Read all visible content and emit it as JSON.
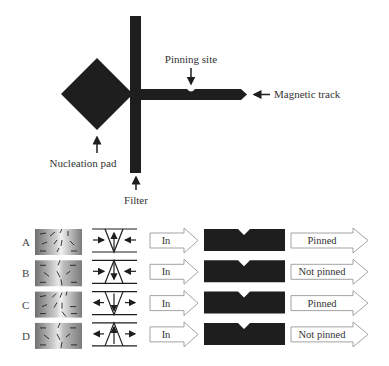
{
  "top_diagram": {
    "labels": {
      "pinning_site": "Pinning site",
      "magnetic_track": "Magnetic track",
      "nucleation_pad": "Nucleation pad",
      "filter": "Filter"
    },
    "colors": {
      "structure": "#1e1e1e",
      "text": "#333333"
    }
  },
  "rows": [
    {
      "id": "A",
      "wall_shape": "V-down",
      "center_arrow": "up",
      "side_arrows": "inward",
      "input": "In",
      "result": "Pinned"
    },
    {
      "id": "B",
      "wall_shape": "V-up",
      "center_arrow": "down",
      "side_arrows": "inward",
      "input": "In",
      "result": "Not pinned"
    },
    {
      "id": "C",
      "wall_shape": "V-down",
      "center_arrow": "down",
      "side_arrows": "outward",
      "input": "In",
      "result": "Pinned"
    },
    {
      "id": "D",
      "wall_shape": "V-up",
      "center_arrow": "up",
      "side_arrows": "outward",
      "input": "In",
      "result": "Not pinned"
    }
  ]
}
